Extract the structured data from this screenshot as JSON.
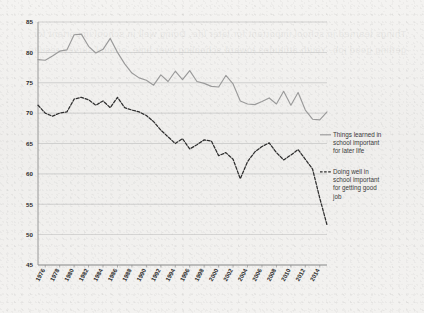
{
  "figure": {
    "background_color": "#f2f1ef",
    "grid_color": "#b9b9b9",
    "axis_color": "#8f8f8f",
    "bleed_text": "Things learned in school important for later life. Doing well in school important for getting good job. Youth attitudes toward schooling over time, annual survey results."
  },
  "legend": {
    "position": "right",
    "entries": [
      {
        "name": "solid",
        "style": "solid",
        "color": "#9a9a9a",
        "label": "Things learned in school important for later life"
      },
      {
        "name": "dashed",
        "style": "dashed",
        "color": "#2e2e2e",
        "label": "Doing well in school important for getting good job"
      }
    ]
  },
  "chart_data": {
    "type": "line",
    "title": "",
    "xlabel": "",
    "ylabel": "",
    "xlim": [
      1975,
      2015
    ],
    "ylim": [
      45,
      85
    ],
    "yticks": [
      45,
      50,
      55,
      60,
      65,
      70,
      75,
      80,
      85
    ],
    "xticks": [
      1976,
      1978,
      1980,
      1982,
      1984,
      1986,
      1988,
      1990,
      1992,
      1994,
      1996,
      1998,
      2000,
      2002,
      2004,
      2006,
      2008,
      2010,
      2012,
      2014
    ],
    "grid": true,
    "x": [
      1975,
      1976,
      1977,
      1978,
      1979,
      1980,
      1981,
      1982,
      1983,
      1984,
      1985,
      1986,
      1987,
      1988,
      1989,
      1990,
      1991,
      1992,
      1993,
      1994,
      1995,
      1996,
      1997,
      1998,
      1999,
      2000,
      2001,
      2002,
      2003,
      2004,
      2005,
      2006,
      2007,
      2008,
      2009,
      2010,
      2011,
      2012,
      2013,
      2014,
      2015
    ],
    "series": [
      {
        "name": "Things learned in school important for later life",
        "style": "solid",
        "color": "#9a9a9a",
        "values": [
          78.8,
          78.7,
          79.4,
          80.2,
          80.4,
          82.9,
          83.0,
          81.0,
          79.9,
          80.5,
          82.3,
          80.0,
          78.1,
          76.6,
          75.8,
          75.4,
          74.6,
          76.3,
          75.2,
          76.9,
          75.5,
          77.0,
          75.2,
          74.9,
          74.4,
          74.3,
          76.2,
          74.8,
          72.0,
          71.5,
          71.4,
          71.9,
          72.5,
          71.5,
          73.6,
          71.3,
          73.4,
          70.5,
          69.0,
          68.9,
          70.2
        ]
      },
      {
        "name": "Doing well in school important for getting good job",
        "style": "dashed",
        "color": "#2e2e2e",
        "values": [
          71.3,
          70.0,
          69.5,
          70.0,
          70.2,
          72.3,
          72.6,
          72.2,
          71.3,
          72.0,
          70.9,
          72.6,
          70.9,
          70.5,
          70.2,
          69.6,
          68.6,
          67.2,
          66.1,
          65.0,
          65.8,
          64.1,
          64.8,
          65.6,
          65.4,
          63.0,
          63.5,
          62.4,
          59.2,
          62.0,
          63.6,
          64.5,
          65.1,
          63.5,
          62.3,
          63.1,
          64.0,
          62.4,
          60.8,
          56.0,
          51.6
        ]
      }
    ]
  }
}
